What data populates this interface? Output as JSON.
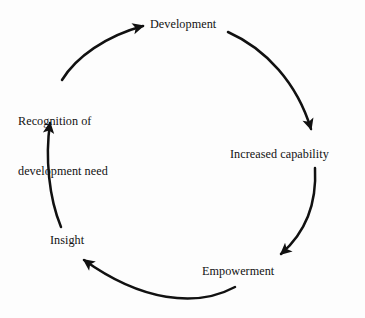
{
  "diagram": {
    "type": "cycle",
    "background_color": "#fdfdfd",
    "stroke_color": "#111111",
    "text_color": "#121212",
    "nodes": [
      {
        "id": "development",
        "label": "Development",
        "position": "top"
      },
      {
        "id": "capability",
        "label": "Increased capability",
        "position": "right"
      },
      {
        "id": "empowerment",
        "label": "Empowerment",
        "position": "bottom-right"
      },
      {
        "id": "insight",
        "label": "Insight",
        "position": "bottom-left"
      },
      {
        "id": "recognition",
        "label_line_1": "Recognition of",
        "label_line_2": "development need",
        "position": "left"
      }
    ],
    "edges": [
      {
        "from": "development",
        "to": "capability",
        "direction": "clockwise"
      },
      {
        "from": "capability",
        "to": "empowerment",
        "direction": "clockwise"
      },
      {
        "from": "empowerment",
        "to": "insight",
        "direction": "clockwise"
      },
      {
        "from": "insight",
        "to": "recognition",
        "direction": "clockwise"
      },
      {
        "from": "recognition",
        "to": "development",
        "direction": "clockwise"
      }
    ]
  }
}
